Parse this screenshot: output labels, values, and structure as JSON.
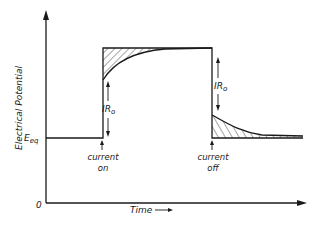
{
  "diagram": {
    "y_axis_label": "Electrical Potential",
    "x_axis_label": "Time",
    "x_axis_arrow": "→",
    "origin_label": "0",
    "baseline_label": "E",
    "baseline_subscript": "eq",
    "drop_label_on": "IR",
    "drop_label_on_subscript": "o",
    "drop_label_off": "IR",
    "drop_label_off_subscript": "o",
    "event_on": {
      "line1": "current",
      "line2": "on"
    },
    "event_off": {
      "line1": "current",
      "line2": "off"
    },
    "colors": {
      "ink": "#1a1a1a",
      "background": "#ffffff"
    }
  }
}
